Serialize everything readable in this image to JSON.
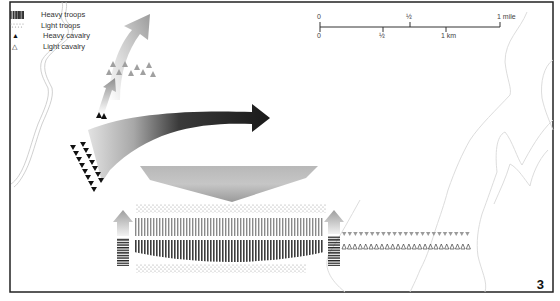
{
  "legend": {
    "items": [
      {
        "symbol": "vertical-hatch",
        "label": "Heavy troops"
      },
      {
        "symbol": "dots",
        "label": "Light troops"
      },
      {
        "symbol": "filled-triangle",
        "glyph": "▲",
        "label": "Heavy cavalry"
      },
      {
        "symbol": "open-triangle",
        "glyph": "△",
        "label": "Light cavalry"
      }
    ]
  },
  "scale_bar": {
    "miles": {
      "zero": "0",
      "half": "½",
      "end": "1 mile"
    },
    "km": {
      "zero": "0",
      "half": "½",
      "end": "1 km"
    }
  },
  "plate_number": "3",
  "colors": {
    "frame": "#222222",
    "river": "#bdbdbd",
    "contour": "#d6d6d6",
    "heavy_cavalry": "#111111",
    "light_troops": "#9a9a9a",
    "arrow_dark": "#1a1a1a",
    "arrow_light": "#d0d0d0"
  }
}
